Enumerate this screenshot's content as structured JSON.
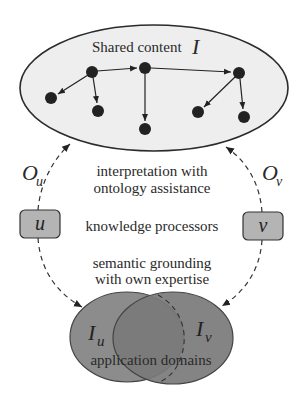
{
  "diagram": {
    "shared_region": {
      "title": "Shared content",
      "symbol": "I",
      "fill": "#eeeeee",
      "stroke": "#2b2b2b"
    },
    "graph": {
      "node_color": "#222222",
      "nodes": [
        {
          "id": "n1",
          "x": 92,
          "y": 72
        },
        {
          "id": "n2",
          "x": 145,
          "y": 68
        },
        {
          "id": "n3",
          "x": 239,
          "y": 73
        },
        {
          "id": "n4",
          "x": 51,
          "y": 98
        },
        {
          "id": "n5",
          "x": 98,
          "y": 111
        },
        {
          "id": "n6",
          "x": 145,
          "y": 129
        },
        {
          "id": "n7",
          "x": 198,
          "y": 112
        },
        {
          "id": "n8",
          "x": 244,
          "y": 117
        }
      ],
      "edges": [
        {
          "from": "n1",
          "to": "n2"
        },
        {
          "from": "n2",
          "to": "n3"
        },
        {
          "from": "n1",
          "to": "n4"
        },
        {
          "from": "n1",
          "to": "n5"
        },
        {
          "from": "n2",
          "to": "n6"
        },
        {
          "from": "n3",
          "to": "n7"
        },
        {
          "from": "n3",
          "to": "n8"
        }
      ]
    },
    "ontology_labels": {
      "left": {
        "main": "O",
        "sub": "u"
      },
      "right": {
        "main": "O",
        "sub": "v"
      }
    },
    "processors": {
      "left": {
        "label": "u",
        "fill": "#b4b4b4"
      },
      "right": {
        "label": "v",
        "fill": "#b4b4b4"
      }
    },
    "center_text": {
      "interpretation_line1": "interpretation with",
      "interpretation_line2": "ontology assistance",
      "processors": "knowledge processors",
      "grounding_line1": "semantic grounding",
      "grounding_line2": "with own expertise"
    },
    "domains": {
      "left": {
        "main": "I",
        "sub": "u",
        "fill": "#8c8c8c"
      },
      "right": {
        "main": "I",
        "sub": "v",
        "fill": "#7a7a7a"
      },
      "caption": "application domains"
    }
  }
}
